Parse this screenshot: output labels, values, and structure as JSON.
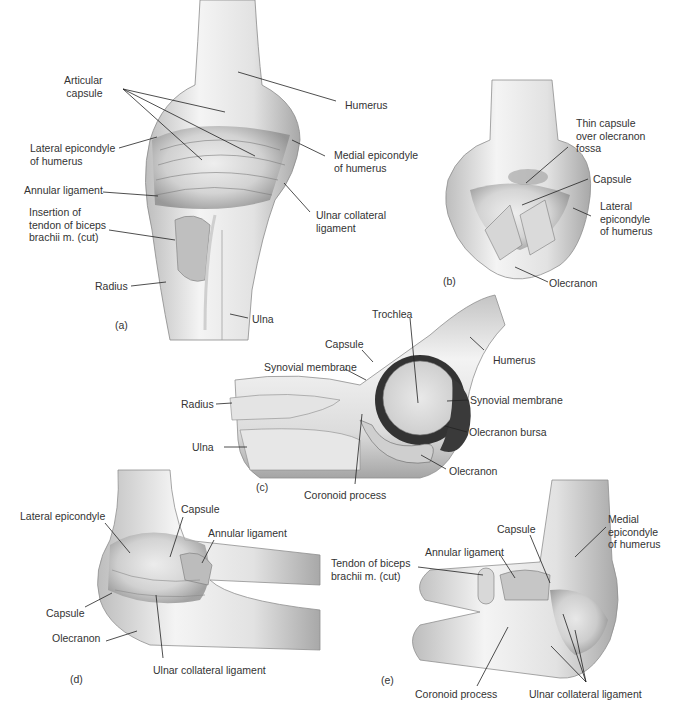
{
  "figure": {
    "panels": [
      {
        "id": "a",
        "tag": "(a)",
        "labels": [
          {
            "text": "Articular capsule",
            "lines": [
              "Articular",
              "capsule"
            ]
          },
          {
            "text": "Lateral epicondyle of humerus",
            "lines": [
              "Lateral epicondyle",
              "of humerus"
            ]
          },
          {
            "text": "Annular ligament",
            "lines": [
              "Annular ligament"
            ]
          },
          {
            "text": "Insertion of tendon of biceps brachii m. (cut)",
            "lines": [
              "Insertion of",
              "tendon of biceps",
              "brachii m. (cut)"
            ]
          },
          {
            "text": "Radius",
            "lines": [
              "Radius"
            ]
          },
          {
            "text": "Humerus",
            "lines": [
              "Humerus"
            ]
          },
          {
            "text": "Medial epicondyle of humerus",
            "lines": [
              "Medial epicondyle",
              "of humerus"
            ]
          },
          {
            "text": "Ulnar collateral ligament",
            "lines": [
              "Ulnar collateral",
              "ligament"
            ]
          },
          {
            "text": "Ulna",
            "lines": [
              "Ulna"
            ]
          }
        ]
      },
      {
        "id": "b",
        "tag": "(b)",
        "labels": [
          {
            "text": "Thin capsule over olecranon fossa",
            "lines": [
              "Thin capsule",
              "over olecranon",
              "fossa"
            ]
          },
          {
            "text": "Capsule",
            "lines": [
              "Capsule"
            ]
          },
          {
            "text": "Lateral epicondyle of humerus",
            "lines": [
              "Lateral",
              "epicondyle",
              "of humerus"
            ]
          },
          {
            "text": "Olecranon",
            "lines": [
              "Olecranon"
            ]
          }
        ]
      },
      {
        "id": "c",
        "tag": "(c)",
        "labels": [
          {
            "text": "Trochlea",
            "lines": [
              "Trochlea"
            ]
          },
          {
            "text": "Capsule",
            "lines": [
              "Capsule"
            ]
          },
          {
            "text": "Synovial membrane",
            "lines": [
              "Synovial membrane"
            ]
          },
          {
            "text": "Humerus",
            "lines": [
              "Humerus"
            ]
          },
          {
            "text": "Radius",
            "lines": [
              "Radius"
            ]
          },
          {
            "text": "Synovial membrane",
            "lines": [
              "Synovial membrane"
            ]
          },
          {
            "text": "Ulna",
            "lines": [
              "Ulna"
            ]
          },
          {
            "text": "Olecranon bursa",
            "lines": [
              "Olecranon bursa"
            ]
          },
          {
            "text": "Olecranon",
            "lines": [
              "Olecranon"
            ]
          },
          {
            "text": "Coronoid process",
            "lines": [
              "Coronoid process"
            ]
          }
        ]
      },
      {
        "id": "d",
        "tag": "(d)",
        "labels": [
          {
            "text": "Lateral epicondyle",
            "lines": [
              "Lateral epicondyle"
            ]
          },
          {
            "text": "Capsule",
            "lines": [
              "Capsule"
            ]
          },
          {
            "text": "Annular ligament",
            "lines": [
              "Annular ligament"
            ]
          },
          {
            "text": "Capsule",
            "lines": [
              "Capsule"
            ]
          },
          {
            "text": "Olecranon",
            "lines": [
              "Olecranon"
            ]
          },
          {
            "text": "Ulnar collateral ligament",
            "lines": [
              "Ulnar collateral ligament"
            ]
          }
        ]
      },
      {
        "id": "e",
        "tag": "(e)",
        "labels": [
          {
            "text": "Medial epicondyle of humerus",
            "lines": [
              "Medial",
              "epicondyle",
              "of humerus"
            ]
          },
          {
            "text": "Capsule",
            "lines": [
              "Capsule"
            ]
          },
          {
            "text": "Annular ligament",
            "lines": [
              "Annular ligament"
            ]
          },
          {
            "text": "Tendon of biceps brachii m. (cut)",
            "lines": [
              "Tendon of biceps",
              "brachii m. (cut)"
            ]
          },
          {
            "text": "Coronoid process",
            "lines": [
              "Coronoid process"
            ]
          },
          {
            "text": "Ulnar collateral ligament",
            "lines": [
              "Ulnar collateral ligament"
            ]
          }
        ]
      }
    ]
  }
}
